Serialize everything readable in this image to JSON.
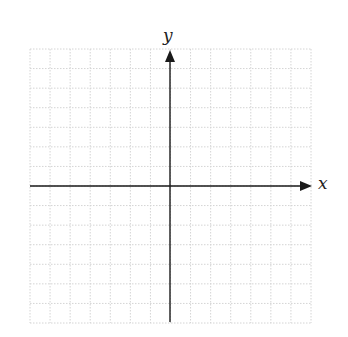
{
  "diagram": {
    "type": "coordinate-plane",
    "x_axis_label": "x",
    "y_axis_label": "y",
    "grid": {
      "left": 30,
      "top": 49,
      "right": 311,
      "bottom": 323,
      "columns": 14,
      "rows": 14,
      "line_color": "#d4d4d4",
      "line_style": "dotted"
    },
    "axes": {
      "color": "#1a1a1a",
      "origin_x": 170,
      "origin_y": 186,
      "x_start": 30,
      "x_end": 312,
      "y_start": 322,
      "y_end": 50
    }
  }
}
